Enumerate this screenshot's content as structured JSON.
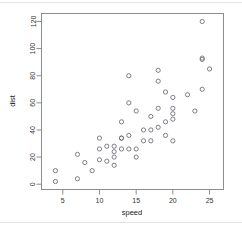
{
  "figure": {
    "kind": "r-base-scatter-plot",
    "background_color": "#ffffff",
    "frame_color": "#8d8d8d",
    "point_color": "#6f6f7a",
    "point_symbol": "open-circle"
  },
  "chart_data": {
    "type": "scatter",
    "title": "",
    "xlabel": "speed",
    "ylabel": "dist",
    "xlim": [
      2.1,
      26.9
    ],
    "ylim": [
      -3.9,
      125.9
    ],
    "xticks": [
      5,
      10,
      15,
      20,
      25
    ],
    "yticks": [
      0,
      20,
      40,
      60,
      80,
      100,
      120
    ],
    "xtick_labels": [
      "5",
      "10",
      "15",
      "20",
      "25"
    ],
    "ytick_labels": [
      "0",
      "20",
      "40",
      "60",
      "80",
      "100",
      "120"
    ],
    "grid": false,
    "legend": false,
    "legend_position": "none",
    "n_points": 50,
    "series": [
      {
        "name": "cars",
        "x": [
          4,
          4,
          7,
          7,
          8,
          9,
          10,
          10,
          10,
          11,
          11,
          12,
          12,
          12,
          12,
          13,
          13,
          13,
          13,
          14,
          14,
          14,
          14,
          15,
          15,
          15,
          16,
          16,
          17,
          17,
          17,
          18,
          18,
          18,
          18,
          19,
          19,
          19,
          20,
          20,
          20,
          20,
          20,
          22,
          23,
          24,
          24,
          24,
          24,
          25
        ],
        "y": [
          2,
          10,
          4,
          22,
          16,
          10,
          18,
          26,
          34,
          17,
          28,
          14,
          20,
          24,
          28,
          26,
          34,
          34,
          46,
          26,
          36,
          60,
          80,
          20,
          26,
          54,
          32,
          40,
          32,
          40,
          50,
          42,
          56,
          76,
          84,
          36,
          46,
          68,
          32,
          48,
          52,
          56,
          64,
          66,
          54,
          70,
          92,
          93,
          120,
          85
        ]
      }
    ]
  }
}
